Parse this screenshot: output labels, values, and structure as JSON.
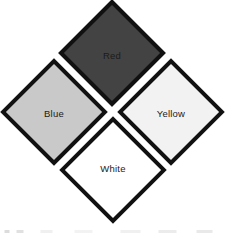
{
  "figure": {
    "canvas": {
      "width": 225,
      "height": 236,
      "background_color": "#ffffff"
    },
    "diagram_type": "four-diamond-cluster",
    "border_color": "#111111",
    "diamonds": [
      {
        "id": "red",
        "label": "Red",
        "position": "top",
        "fill_color": "#434343",
        "label_color": "#1b1b1b"
      },
      {
        "id": "blue",
        "label": "Blue",
        "position": "left",
        "fill_color": "#c9c9c9",
        "label_color": "#1b1b1b"
      },
      {
        "id": "yellow",
        "label": "Yellow",
        "position": "right",
        "fill_color": "#f2f2f2",
        "label_color": "#1b1b1b"
      },
      {
        "id": "white",
        "label": "White",
        "position": "bottom",
        "fill_color": "#ffffff",
        "label_color": "#1b1b1b"
      }
    ]
  }
}
